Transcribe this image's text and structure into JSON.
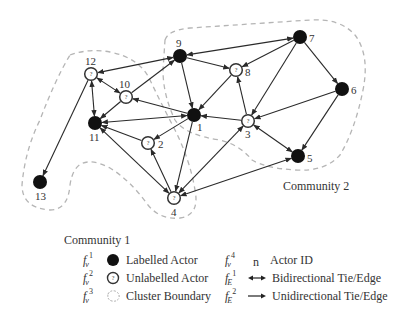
{
  "diagram": {
    "type": "social-network-graph",
    "nodes": [
      {
        "id": "1",
        "x": 194,
        "y": 115,
        "kind": "labelled",
        "label_dx": 3,
        "label_dy": 16
      },
      {
        "id": "2",
        "x": 148,
        "y": 143,
        "kind": "unlabelled",
        "label_dx": 10,
        "label_dy": 5
      },
      {
        "id": "3",
        "x": 248,
        "y": 121,
        "kind": "unlabelled",
        "label_dx": -3,
        "label_dy": 17
      },
      {
        "id": "4",
        "x": 174,
        "y": 198,
        "kind": "unlabelled",
        "label_dx": -3,
        "label_dy": 18
      },
      {
        "id": "5",
        "x": 298,
        "y": 156,
        "kind": "labelled",
        "label_dx": 9,
        "label_dy": 6
      },
      {
        "id": "6",
        "x": 342,
        "y": 89,
        "kind": "labelled",
        "label_dx": 9,
        "label_dy": 5
      },
      {
        "id": "7",
        "x": 300,
        "y": 37,
        "kind": "labelled",
        "label_dx": 9,
        "label_dy": 5
      },
      {
        "id": "8",
        "x": 236,
        "y": 70,
        "kind": "unlabelled",
        "label_dx": 9,
        "label_dy": 6
      },
      {
        "id": "9",
        "x": 180,
        "y": 56,
        "kind": "labelled",
        "label_dx": -4,
        "label_dy": -9
      },
      {
        "id": "10",
        "x": 126,
        "y": 97,
        "kind": "unlabelled",
        "label_dx": -7,
        "label_dy": -9
      },
      {
        "id": "11",
        "x": 95,
        "y": 123,
        "kind": "labelled",
        "label_dx": -6,
        "label_dy": 18
      },
      {
        "id": "12",
        "x": 91,
        "y": 74,
        "kind": "unlabelled",
        "label_dx": -6,
        "label_dy": -9
      },
      {
        "id": "13",
        "x": 40,
        "y": 182,
        "kind": "labelled",
        "label_dx": -5,
        "label_dy": 18
      }
    ],
    "edges": [
      {
        "from": "7",
        "to": "9",
        "dir": "bi"
      },
      {
        "from": "9",
        "to": "12",
        "dir": "bi"
      },
      {
        "from": "9",
        "to": "8",
        "dir": "uni"
      },
      {
        "from": "9",
        "to": "1",
        "dir": "uni"
      },
      {
        "from": "10",
        "to": "9",
        "dir": "uni"
      },
      {
        "from": "12",
        "to": "10",
        "dir": "bi"
      },
      {
        "from": "12",
        "to": "11",
        "dir": "bi"
      },
      {
        "from": "12",
        "to": "13",
        "dir": "uni"
      },
      {
        "from": "10",
        "to": "11",
        "dir": "uni"
      },
      {
        "from": "1",
        "to": "10",
        "dir": "uni"
      },
      {
        "from": "11",
        "to": "1",
        "dir": "bi"
      },
      {
        "from": "1",
        "to": "2",
        "dir": "uni"
      },
      {
        "from": "1",
        "to": "4",
        "dir": "uni"
      },
      {
        "from": "2",
        "to": "11",
        "dir": "uni"
      },
      {
        "from": "4",
        "to": "11",
        "dir": "bi"
      },
      {
        "from": "4",
        "to": "2",
        "dir": "uni"
      },
      {
        "from": "7",
        "to": "8",
        "dir": "uni"
      },
      {
        "from": "8",
        "to": "1",
        "dir": "uni"
      },
      {
        "from": "3",
        "to": "8",
        "dir": "uni"
      },
      {
        "from": "3",
        "to": "1",
        "dir": "uni"
      },
      {
        "from": "7",
        "to": "3",
        "dir": "uni"
      },
      {
        "from": "7",
        "to": "6",
        "dir": "uni"
      },
      {
        "from": "6",
        "to": "3",
        "dir": "uni"
      },
      {
        "from": "6",
        "to": "5",
        "dir": "uni"
      },
      {
        "from": "3",
        "to": "5",
        "dir": "bi"
      },
      {
        "from": "4",
        "to": "3",
        "dir": "bi"
      },
      {
        "from": "5",
        "to": "4",
        "dir": "bi"
      }
    ],
    "communities": [
      {
        "label": "Community 1",
        "label_x": 64,
        "label_y": 244
      },
      {
        "label": "Community 2",
        "label_x": 283,
        "label_y": 190
      }
    ],
    "colors": {
      "edge": "#2a2a2a",
      "labelled_fill": "#111111",
      "unlabelled_stroke": "#333333",
      "boundary": "#b5b5b5"
    },
    "unlabelled_mark": "?"
  },
  "legend": {
    "left": [
      {
        "sym": "f",
        "sub": "v",
        "sup": "1",
        "label": "Labelled Actor"
      },
      {
        "sym": "f",
        "sub": "v",
        "sup": "2",
        "label": "Unlabelled Actor"
      },
      {
        "sym": "f",
        "sub": "v",
        "sup": "3",
        "label": "Cluster Boundary"
      }
    ],
    "right": [
      {
        "sym": "f",
        "sub": "v",
        "sup": "4",
        "glyph_text": "n",
        "label": "Actor ID"
      },
      {
        "sym": "f",
        "sub": "E",
        "sup": "1",
        "label": "Bidirectional Tie/Edge"
      },
      {
        "sym": "f",
        "sub": "E",
        "sup": "2",
        "label": "Unidirectional Tie/Edge"
      }
    ]
  }
}
